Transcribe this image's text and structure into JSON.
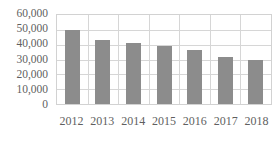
{
  "chart_data": {
    "type": "bar",
    "title": "",
    "subtitle": "",
    "xlabel": "",
    "ylabel": "",
    "categories": [
      "2012",
      "2013",
      "2014",
      "2015",
      "2016",
      "2017",
      "2018"
    ],
    "values": [
      50000,
      43000,
      41000,
      39000,
      36500,
      31500,
      30000
    ],
    "series": [
      {
        "name": "",
        "values": [
          50000,
          43000,
          41000,
          39000,
          36500,
          31500,
          30000
        ]
      }
    ],
    "ylim": [
      0,
      60000
    ],
    "yticks": [
      0,
      10000,
      20000,
      30000,
      40000,
      50000,
      60000
    ],
    "ytick_labels": [
      "0",
      "10,000",
      "20,000",
      "30,000",
      "40,000",
      "50,000",
      "60,000"
    ],
    "xtick_labels": [
      "2012",
      "2013",
      "2014",
      "2015",
      "2016",
      "2017",
      "2018"
    ],
    "grid": {
      "horizontal": true,
      "vertical": true
    },
    "legend": {
      "visible": false,
      "position": "none",
      "entries": []
    },
    "annotations": [],
    "colors": {
      "bar_fill": "#8c8c8c",
      "gridline": "#d6d6d6",
      "plot_border": "#d2d2d2",
      "tick_label": "#5f5f5f",
      "background": "#ffffff"
    }
  }
}
